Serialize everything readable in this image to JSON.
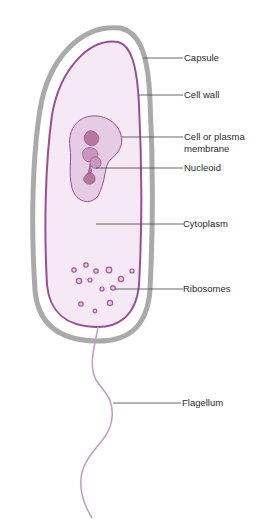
{
  "colors": {
    "capsule": "#a9aaa9",
    "membrane": "#9a4e96",
    "cytoplasm": "#f4e9f4",
    "nucleoid_region": "#e6cbe4",
    "nucleoid": "#b7779f",
    "ribosome": "#a05a9c",
    "flagellum": "#c39ac3",
    "leader_line": "#444444",
    "label_text": "#2a2a2a"
  },
  "labels": [
    {
      "id": "capsule",
      "text": "Capsule"
    },
    {
      "id": "cell_wall",
      "text": "Cell wall"
    },
    {
      "id": "cell_membrane",
      "text": "Cell or plasma",
      "text2": "membrane"
    },
    {
      "id": "nucleoid",
      "text": "Nucleoid"
    },
    {
      "id": "cytoplasm",
      "text": "Cytoplasm"
    },
    {
      "id": "ribosomes",
      "text": "Ribosomes"
    },
    {
      "id": "flagellum",
      "text": "Flagellum"
    }
  ]
}
